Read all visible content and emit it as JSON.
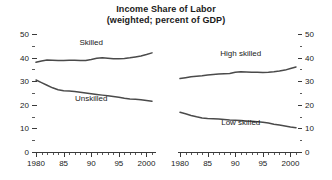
{
  "chart_data": {
    "type": "line",
    "title": "Income Share of Labor",
    "subtitle": "(weighted; percent of GDP)",
    "xlabel": "",
    "ylabel": "",
    "grid": false,
    "legend_position": "inline-annotations",
    "xlim": [
      1980,
      2001
    ],
    "ylim": [
      0,
      50
    ],
    "ytick_labels": [
      "50",
      "40",
      "30",
      "20",
      "10",
      "0"
    ],
    "ytick_values": [
      50,
      40,
      30,
      20,
      10,
      0
    ],
    "yminor_step": 5,
    "xtick_labels": [
      "1980",
      "85",
      "90",
      "95",
      "2000"
    ],
    "xtick_values": [
      1980,
      1985,
      1990,
      1995,
      2000
    ],
    "xminor_step": 1,
    "panels": [
      {
        "name": "left-panel",
        "y_axis_side": "left",
        "series": [
          {
            "name": "Skilled",
            "label": "Skilled",
            "label_x": 1990,
            "label_y": 45.5,
            "x": [
              1980,
              1981,
              1982,
              1983,
              1984,
              1985,
              1986,
              1987,
              1988,
              1989,
              1990,
              1991,
              1992,
              1993,
              1994,
              1995,
              1996,
              1997,
              1998,
              1999,
              2000,
              2001
            ],
            "values": [
              38.0,
              38.6,
              39.0,
              38.9,
              38.8,
              38.8,
              38.9,
              38.9,
              38.8,
              38.8,
              39.2,
              39.7,
              39.9,
              39.7,
              39.5,
              39.5,
              39.6,
              39.9,
              40.3,
              40.7,
              41.3,
              42.0
            ]
          },
          {
            "name": "Unskilled",
            "label": "Unskilled",
            "label_x": 1990,
            "label_y": 21.5,
            "x": [
              1980,
              1981,
              1982,
              1983,
              1984,
              1985,
              1986,
              1987,
              1988,
              1989,
              1990,
              1991,
              1992,
              1993,
              1994,
              1995,
              1996,
              1997,
              1998,
              1999,
              2000,
              2001
            ],
            "values": [
              30.5,
              29.4,
              28.3,
              27.2,
              26.4,
              26.0,
              25.8,
              25.6,
              25.3,
              25.0,
              24.7,
              24.4,
              24.1,
              23.8,
              23.5,
              23.2,
              22.8,
              22.5,
              22.3,
              22.1,
              21.8,
              21.5
            ]
          }
        ]
      },
      {
        "name": "right-panel",
        "y_axis_side": "right",
        "series": [
          {
            "name": "High skilled",
            "label": "High skilled",
            "label_x": 1991,
            "label_y": 40.5,
            "x": [
              1980,
              1981,
              1982,
              1983,
              1984,
              1985,
              1986,
              1987,
              1988,
              1989,
              1990,
              1991,
              1992,
              1993,
              1994,
              1995,
              1996,
              1997,
              1998,
              1999,
              2000,
              2001
            ],
            "values": [
              31.1,
              31.5,
              31.9,
              32.1,
              32.3,
              32.6,
              32.8,
              33.0,
              33.2,
              33.3,
              33.8,
              34.0,
              33.9,
              33.8,
              33.8,
              33.7,
              33.8,
              34.0,
              34.3,
              34.7,
              35.4,
              36.0
            ]
          },
          {
            "name": "Low skilled",
            "label": "Low skilled",
            "label_x": 1991,
            "label_y": 11.5,
            "x": [
              1980,
              1981,
              1982,
              1983,
              1984,
              1985,
              1986,
              1987,
              1988,
              1989,
              1990,
              1991,
              1992,
              1993,
              1994,
              1995,
              1996,
              1997,
              1998,
              1999,
              2000,
              2001
            ],
            "values": [
              16.8,
              16.2,
              15.5,
              14.9,
              14.4,
              14.2,
              14.1,
              14.0,
              13.8,
              13.6,
              13.5,
              13.3,
              13.1,
              13.0,
              12.8,
              12.6,
              12.3,
              11.8,
              11.4,
              11.0,
              10.6,
              10.3
            ]
          }
        ]
      }
    ]
  }
}
